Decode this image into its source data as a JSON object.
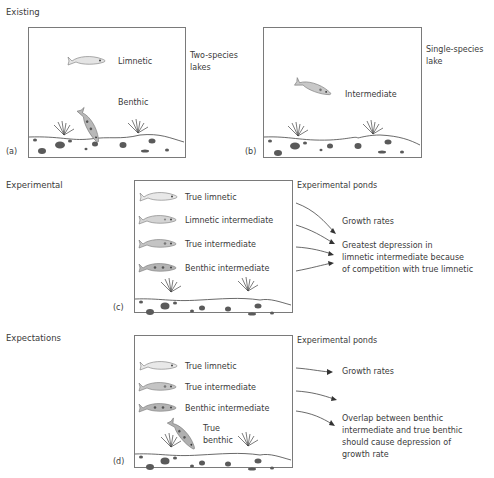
{
  "sections": {
    "existing": "Existing",
    "experimental": "Experimental",
    "expectations": "Expectations"
  },
  "panel_a": {
    "tag": "(a)",
    "side_label_line1": "Two-species",
    "side_label_line2": "lakes",
    "fish": [
      {
        "label": "Limnetic",
        "type": "limnetic"
      },
      {
        "label": "Benthic",
        "type": "benthic"
      }
    ]
  },
  "panel_b": {
    "tag": "(b)",
    "side_label_line1": "Single-species",
    "side_label_line2": "lake",
    "fish": [
      {
        "label": "Intermediate",
        "type": "intermediate"
      }
    ]
  },
  "panel_c": {
    "tag": "(c)",
    "side_label": "Experimental ponds",
    "fish": [
      {
        "label": "True limnetic"
      },
      {
        "label": "Limnetic intermediate"
      },
      {
        "label": "True intermediate"
      },
      {
        "label": "Benthic intermediate"
      }
    ],
    "result_1": "Growth rates",
    "result_2_lines": [
      "Greatest depression in",
      "limnetic intermediate because",
      "of competition with true limnetic"
    ]
  },
  "panel_d": {
    "tag": "(d)",
    "side_label": "Experimental ponds",
    "fish": [
      {
        "label": "True limnetic"
      },
      {
        "label": "True intermediate"
      },
      {
        "label": "Benthic intermediate"
      },
      {
        "label_line1": "True",
        "label_line2": "benthic"
      }
    ],
    "result_1": "Growth rates",
    "result_2_lines": [
      "Overlap between benthic",
      "intermediate and true benthic",
      "should cause depression of",
      "growth rate"
    ]
  },
  "colors": {
    "border": "#7a7a7a",
    "fish_light": "#e4e4e4",
    "fish_mid": "#c8c8c8",
    "fish_dark": "#a8a8a8",
    "pebble": "#5a5a5a",
    "line": "#444444"
  }
}
